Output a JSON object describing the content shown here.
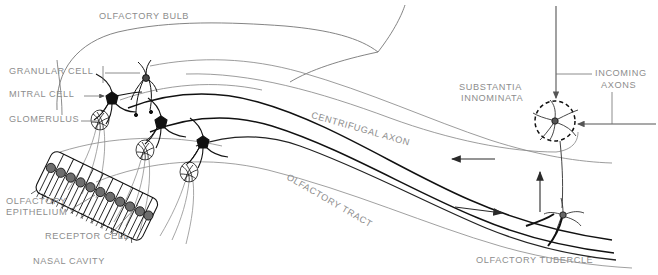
{
  "figure": {
    "domain": "anatomical line diagram",
    "background_color": "#ffffff",
    "ink_color": "#1a1a1a",
    "label_color": "#8d8d8d",
    "faint_line_color": "#9a9a9a"
  },
  "labels": {
    "olfactory_bulb": "OLFACTORY BULB",
    "granular_cell": "GRANULAR CELL",
    "mitral_cell": "MITRAL CELL",
    "glomerulus": "GLOMERULUS",
    "olfactory_epithelium_line1": "OLFACTORY",
    "olfactory_epithelium_line2": "EPITHELIUM",
    "receptor_cell": "RECEPTOR CELL",
    "nasal_cavity": "NASAL CAVITY",
    "centrifugal_axon": "CENTRIFUGAL AXON",
    "olfactory_tract": "OLFACTORY TRACT",
    "substantia_line1": "SUBSTANTIA",
    "substantia_line2": "INNOMINATA",
    "incoming_axons_line1": "INCOMING",
    "incoming_axons_line2": "AXONS",
    "olfactory_tubercle": "OLFACTORY TUBERCLE"
  },
  "structures": {
    "mitral_cells_count": 3,
    "glomeruli_count": 3,
    "granular_cells_count": 1,
    "receptor_cell_slabs": 11,
    "tract_arrow_directions": [
      "left",
      "right",
      "up"
    ],
    "substantia_marker": "dashed-circle",
    "tubercle_neuron": "multipolar"
  }
}
